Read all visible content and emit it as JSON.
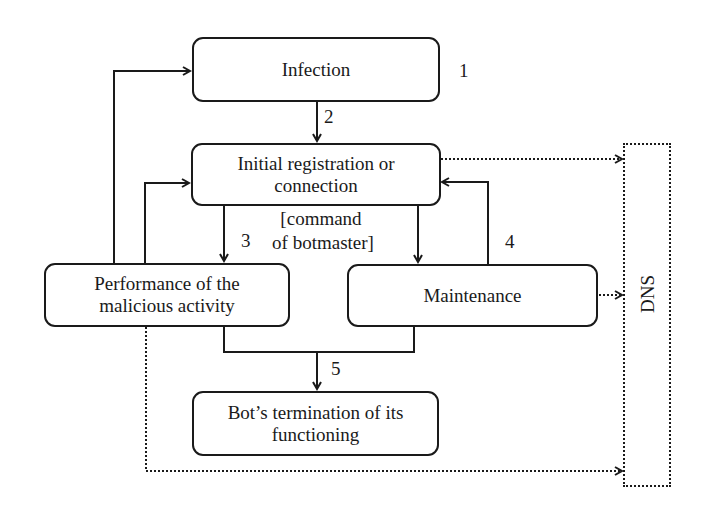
{
  "diagram": {
    "nodes": {
      "infection": "Infection",
      "registration_line1": "Initial registration or",
      "registration_line2": "connection",
      "performance_line1": "Performance of the",
      "performance_line2": "malicious activity",
      "maintenance": "Maintenance",
      "termination_line1": "Bot’s termination of its",
      "termination_line2": "functioning",
      "dns": "DNS"
    },
    "step_labels": {
      "step1": "1",
      "step2": "2",
      "step3": "3",
      "step4": "4",
      "step5": "5"
    },
    "annotation": {
      "line1": "[command",
      "line2": "of botmaster]"
    },
    "colors": {
      "stroke": "#1a1a1a",
      "background": "#ffffff"
    }
  }
}
